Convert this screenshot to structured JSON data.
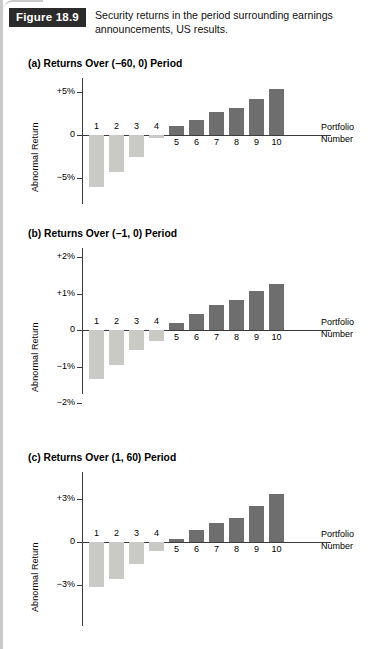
{
  "figure": {
    "tag": "Figure 18.9",
    "caption": "Security returns in the period surrounding earnings announcements, US results."
  },
  "axis_label_y": "Abnormal Return",
  "axis_label_x_line1": "Portfolio",
  "axis_label_x_line2": "Number",
  "colors": {
    "negative_bar": "#c9c9c6",
    "positive_bar": "#6e6e6e",
    "axis": "#3b3b3b",
    "tag_background": "#2b2b2b",
    "tag_text": "#ffffff"
  },
  "panels": [
    {
      "id": "a",
      "title": "(a) Returns Over (−60, 0) Period",
      "ticks": [
        "+5%",
        "0",
        "−5%"
      ]
    },
    {
      "id": "b",
      "title": "(b) Returns Over (−1, 0) Period",
      "ticks": [
        "+2%",
        "+1%",
        "0",
        "−1%",
        "−2%"
      ]
    },
    {
      "id": "c",
      "title": "(c) Returns Over (1, 60) Period",
      "ticks": [
        "+3%",
        "0",
        "−3%"
      ]
    }
  ],
  "chart_data": [
    {
      "type": "bar",
      "title": "(a) Returns Over (−60, 0) Period",
      "xlabel": "Portfolio Number",
      "ylabel": "Abnormal Return",
      "categories": [
        "1",
        "2",
        "3",
        "4",
        "5",
        "6",
        "7",
        "8",
        "9",
        "10"
      ],
      "values": [
        -6.1,
        -4.3,
        -2.6,
        -0.4,
        1.1,
        1.8,
        2.7,
        3.1,
        4.2,
        5.3
      ],
      "yunit": "%",
      "ylim": [
        -7.0,
        7.5
      ],
      "yticks": [
        5,
        0,
        -5
      ],
      "ytick_labels": [
        "+5%",
        "0",
        "−5%"
      ],
      "grid": false,
      "legend": false
    },
    {
      "type": "bar",
      "title": "(b) Returns Over (−1, 0) Period",
      "xlabel": "Portfolio Number",
      "ylabel": "Abnormal Return",
      "categories": [
        "1",
        "2",
        "3",
        "4",
        "5",
        "6",
        "7",
        "8",
        "9",
        "10"
      ],
      "values": [
        -1.35,
        -0.95,
        -0.55,
        -0.3,
        0.18,
        0.45,
        0.68,
        0.83,
        1.07,
        1.27
      ],
      "yunit": "%",
      "ylim": [
        -2.0,
        2.0
      ],
      "yticks": [
        2,
        1,
        0,
        -1,
        -2
      ],
      "ytick_labels": [
        "+2%",
        "+1%",
        "0",
        "−1%",
        "−2%"
      ],
      "grid": false,
      "legend": false
    },
    {
      "type": "bar",
      "title": "(c) Returns Over (1, 60) Period",
      "xlabel": "Portfolio Number",
      "ylabel": "Abnormal Return",
      "categories": [
        "1",
        "2",
        "3",
        "4",
        "5",
        "6",
        "7",
        "8",
        "9",
        "10"
      ],
      "values": [
        -3.15,
        -2.6,
        -1.5,
        -0.6,
        0.2,
        0.8,
        1.35,
        1.65,
        2.5,
        3.3
      ],
      "yunit": "%",
      "ylim": [
        -4.6,
        4.6
      ],
      "yticks": [
        3,
        0,
        -3
      ],
      "ytick_labels": [
        "+3%",
        "0",
        "−3%"
      ],
      "grid": false,
      "legend": false
    }
  ]
}
